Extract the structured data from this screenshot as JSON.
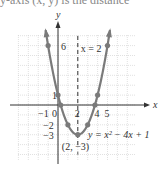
{
  "header": {
    "clipped_text": "y-axis (x, y) is the distance"
  },
  "colors": {
    "curve": "#7a7a7a",
    "axis": "#333333",
    "grid": "#cccccc",
    "symmetry_line": "#333333"
  },
  "chart_data": {
    "type": "line",
    "title": "",
    "xlabel": "x",
    "ylabel": "y",
    "xlim": [
      -4,
      8
    ],
    "ylim": [
      -5.5,
      7
    ],
    "grid": true,
    "function": "y = x^2 - 4x + 1",
    "series": [
      {
        "name": "y = x^2 - 4x + 1",
        "points": [
          [
            -1,
            6
          ],
          [
            0,
            1
          ],
          [
            1,
            -2
          ],
          [
            2,
            -3
          ],
          [
            3,
            -2
          ],
          [
            4,
            1
          ],
          [
            5,
            6
          ]
        ]
      }
    ],
    "x_intercepts": [
      0.27,
      3.73
    ],
    "axis_of_symmetry": {
      "x": 2,
      "label": "x = 2"
    },
    "vertex": {
      "x": 2,
      "y": -3,
      "label": "(2, −3)"
    },
    "curve_label": "y = x² − 4x + 1",
    "x_tick_labels": [
      {
        "value": -1,
        "text": "−1"
      },
      {
        "value": 0,
        "text": "0"
      },
      {
        "value": 2,
        "text": "2"
      },
      {
        "value": 4,
        "text": "4"
      },
      {
        "value": 5,
        "text": "5"
      }
    ],
    "y_tick_labels": [
      {
        "value": 6,
        "text": "6"
      },
      {
        "value": 1,
        "text": "1"
      },
      {
        "value": -2,
        "text": "−2"
      },
      {
        "value": -3,
        "text": "−3"
      }
    ]
  }
}
